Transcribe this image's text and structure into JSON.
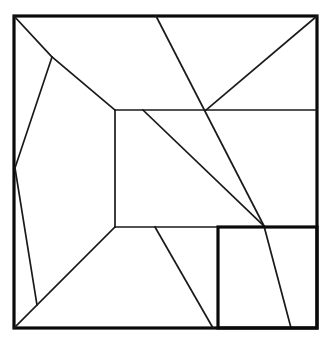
{
  "figure": {
    "type": "line-diagram",
    "canvas": {
      "width": 331,
      "height": 344
    },
    "colors": {
      "background": "#ffffff",
      "border_stroke": "#0a0a0a",
      "partition_stroke": "#1a1a1a"
    },
    "stroke_widths": {
      "outer_border": 3.2,
      "inner_box": 3.2,
      "partition": 1.7
    },
    "outer_square": {
      "name": "outer-square",
      "x": 14,
      "y": 16,
      "width": 303,
      "height": 312,
      "corners": {
        "top_left": [
          14,
          16
        ],
        "top_right": [
          317,
          16
        ],
        "bottom_right": [
          317,
          328
        ],
        "bottom_left": [
          14,
          328
        ]
      }
    },
    "inner_box": {
      "name": "inner-box-bottom-right",
      "x": 218,
      "y": 227,
      "width": 99,
      "height": 101,
      "corners": {
        "top_left": [
          218,
          227
        ],
        "top_right": [
          317,
          227
        ],
        "bottom_right": [
          317,
          328
        ],
        "bottom_left": [
          218,
          328
        ]
      }
    },
    "central_rectangle": {
      "name": "central-rectangle",
      "corners": {
        "top_left": [
          115,
          110
        ],
        "bottom_left": [
          115,
          227
        ]
      }
    },
    "vertices": [
      {
        "name": "top-left-corner",
        "point": [
          14,
          16
        ]
      },
      {
        "name": "upper-left-branch-node",
        "point": [
          52,
          57
        ]
      },
      {
        "name": "left-edge-node",
        "point": [
          15,
          168
        ]
      },
      {
        "name": "lower-left-node",
        "point": [
          37,
          305
        ]
      },
      {
        "name": "bottom-left-corner",
        "point": [
          14,
          328
        ]
      },
      {
        "name": "central-rect-top-left",
        "point": [
          115,
          110
        ]
      },
      {
        "name": "central-rect-bottom-left",
        "point": [
          115,
          227
        ]
      },
      {
        "name": "top-edge-node",
        "point": [
          156,
          16
        ]
      },
      {
        "name": "diagonal-start-node",
        "point": [
          143,
          110
        ]
      },
      {
        "name": "horizontal-crossing-node",
        "point": [
          206,
          110
        ]
      },
      {
        "name": "top-right-corner",
        "point": [
          317,
          16
        ]
      },
      {
        "name": "convergence-node",
        "point": [
          264,
          226
        ]
      },
      {
        "name": "lower-diagonal-start",
        "point": [
          155,
          227
        ]
      },
      {
        "name": "bottom-edge-node-left",
        "point": [
          213,
          328
        ]
      },
      {
        "name": "bottom-edge-node-right",
        "point": [
          291,
          328
        ]
      }
    ],
    "segments": [
      {
        "name": "segment-topleft-to-branch",
        "from": [
          14,
          16
        ],
        "to": [
          52,
          57
        ]
      },
      {
        "name": "segment-branch-to-central-rect",
        "from": [
          52,
          57
        ],
        "to": [
          115,
          110
        ]
      },
      {
        "name": "segment-branch-to-left-edge",
        "from": [
          52,
          57
        ],
        "to": [
          15,
          168
        ]
      },
      {
        "name": "segment-left-edge-to-lower-left",
        "from": [
          15,
          168
        ],
        "to": [
          37,
          305
        ]
      },
      {
        "name": "segment-central-rect-to-bottom-left",
        "from": [
          115,
          227
        ],
        "to": [
          14,
          328
        ]
      },
      {
        "name": "segment-central-rect-left-edge",
        "from": [
          115,
          110
        ],
        "to": [
          115,
          227
        ]
      },
      {
        "name": "segment-horizontal-upper",
        "from": [
          115,
          110
        ],
        "to": [
          317,
          110
        ]
      },
      {
        "name": "segment-horizontal-lower",
        "from": [
          115,
          227
        ],
        "to": [
          218,
          227
        ]
      },
      {
        "name": "segment-top-edge-to-convergence",
        "from": [
          156,
          16
        ],
        "to": [
          264,
          226
        ]
      },
      {
        "name": "segment-topright-to-crossing",
        "from": [
          317,
          16
        ],
        "to": [
          206,
          110
        ]
      },
      {
        "name": "segment-diagonal-to-convergence",
        "from": [
          143,
          110
        ],
        "to": [
          264,
          226
        ]
      },
      {
        "name": "segment-convergence-to-bottom",
        "from": [
          264,
          226
        ],
        "to": [
          291,
          328
        ]
      },
      {
        "name": "segment-lower-diagonal",
        "from": [
          155,
          227
        ],
        "to": [
          213,
          328
        ]
      }
    ]
  }
}
